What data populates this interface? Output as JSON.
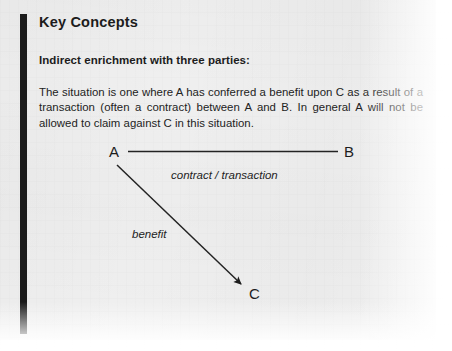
{
  "page": {
    "background_color": "#f4f4f4",
    "paper_color": "#ffffff",
    "ink_color": "#1c1c1c",
    "accent_rule_color": "#1b1b1b"
  },
  "callout": {
    "title": "Key Concepts",
    "subtitle": "Indirect enrichment with three parties:",
    "body": "The situation is one where A has conferred a benefit upon C as a result of a transaction (often a contract) between A and B. In general A will not be allowed to claim against C in this situation."
  },
  "diagram": {
    "type": "node-edge",
    "nodes": [
      {
        "id": "A",
        "label": "A",
        "x": 116,
        "y": 152
      },
      {
        "id": "B",
        "label": "B",
        "x": 350,
        "y": 152
      },
      {
        "id": "C",
        "label": "C",
        "x": 256,
        "y": 294
      }
    ],
    "edges": [
      {
        "id": "a-b",
        "from": "A",
        "to": "B",
        "label": "contract / transaction",
        "style": "plain-line",
        "arrow": false
      },
      {
        "id": "a-c",
        "from": "A",
        "to": "C",
        "label": "benefit",
        "style": "arrow-line",
        "arrow": true
      }
    ]
  }
}
